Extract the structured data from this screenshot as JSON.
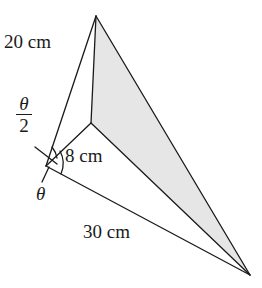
{
  "figure": {
    "type": "triangular pyramid (tetrahedron) diagram",
    "labels": {
      "edge_top": "20 cm",
      "edge_inner": "8 cm",
      "edge_bottom": "30 cm",
      "half_angle_num": "θ",
      "half_angle_den": "2",
      "angle": "θ"
    },
    "colors": {
      "line": "#1a1a1a",
      "shaded_face": "#e6e6e6",
      "background": "#ffffff"
    }
  }
}
